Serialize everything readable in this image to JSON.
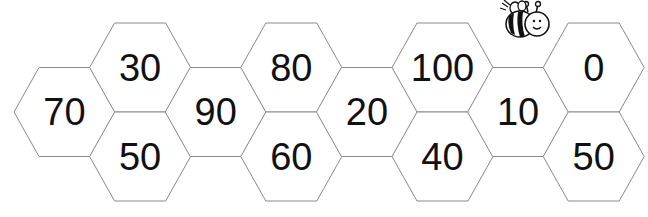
{
  "puzzle": {
    "title": "",
    "stroke_color": "#8a8a8a",
    "text_color": "#111111",
    "cells": [
      {
        "id": "c0-mid",
        "col": 0,
        "row": "mid",
        "value": "70"
      },
      {
        "id": "c1-top",
        "col": 1,
        "row": "top",
        "value": "30"
      },
      {
        "id": "c1-bot",
        "col": 1,
        "row": "bot",
        "value": "50"
      },
      {
        "id": "c2-mid",
        "col": 2,
        "row": "mid",
        "value": "90"
      },
      {
        "id": "c3-top",
        "col": 3,
        "row": "top",
        "value": "80"
      },
      {
        "id": "c3-bot",
        "col": 3,
        "row": "bot",
        "value": "60"
      },
      {
        "id": "c4-mid",
        "col": 4,
        "row": "mid",
        "value": "20"
      },
      {
        "id": "c5-top",
        "col": 5,
        "row": "top",
        "value": "100"
      },
      {
        "id": "c5-bot",
        "col": 5,
        "row": "bot",
        "value": "40"
      },
      {
        "id": "c6-mid",
        "col": 6,
        "row": "mid",
        "value": "10"
      },
      {
        "id": "c7-top",
        "col": 7,
        "row": "top",
        "value": "0"
      },
      {
        "id": "c7-bot",
        "col": 7,
        "row": "bot",
        "value": "50"
      }
    ],
    "decoration": {
      "icon": "bee-icon"
    }
  }
}
